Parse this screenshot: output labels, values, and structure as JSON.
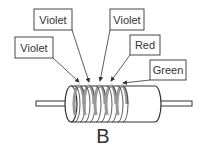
{
  "diagram": {
    "caption": "B",
    "labels": [
      {
        "text": "Violet",
        "box": [
          34,
          9,
          38,
          21
        ],
        "target": [
          89,
          82
        ]
      },
      {
        "text": "Violet",
        "box": [
          15,
          37,
          38,
          21
        ],
        "target": [
          79,
          82
        ]
      },
      {
        "text": "Violet",
        "box": [
          110,
          9,
          34,
          21
        ],
        "target": [
          100,
          81
        ]
      },
      {
        "text": "Red",
        "box": [
          130,
          35,
          30,
          20
        ],
        "target": [
          111,
          81
        ]
      },
      {
        "text": "Green",
        "box": [
          150,
          60,
          36,
          20
        ],
        "target": [
          123,
          83
        ]
      }
    ],
    "bands": [
      79,
      89,
      100,
      111,
      122
    ],
    "colors": {
      "stroke": "#333333",
      "band": "#999999"
    }
  }
}
